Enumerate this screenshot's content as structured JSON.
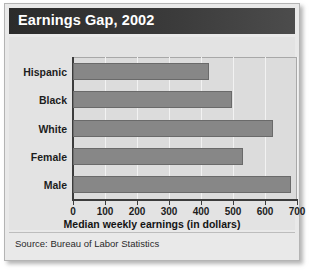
{
  "figure": {
    "title": "Earnings Gap, 2002",
    "source": "Source: Bureau of Labor Statistics",
    "accent_color": "#333333",
    "bar_color": "#878787",
    "plot_bg_color": "#dcdcdc",
    "panel_bg_color": "#e3e3e3"
  },
  "chart_data": {
    "type": "bar",
    "orientation": "horizontal",
    "title": "Earnings Gap, 2002",
    "categories": [
      "Hispanic",
      "Black",
      "White",
      "Female",
      "Male"
    ],
    "values": [
      424,
      498,
      624,
      530,
      680
    ],
    "xlabel": "Median weekly earnings (in dollars)",
    "ylabel": "",
    "xlim": [
      0,
      700
    ],
    "xticks": [
      0,
      100,
      200,
      300,
      400,
      500,
      600,
      700
    ],
    "xtick_labels": [
      "0",
      "100",
      "200",
      "300",
      "400",
      "500",
      "600",
      "700"
    ],
    "grid": true,
    "grid_axis": "x",
    "legend": false,
    "source": "Source: Bureau of Labor Statistics"
  }
}
